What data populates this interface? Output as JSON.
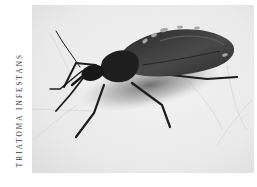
{
  "figure": {
    "caption": "TRIATOMA INFESTANS",
    "photo": {
      "subject": "kissing bug (Triatoma infestans) on pale surface",
      "style": "grayscale photograph",
      "colors": {
        "background": "#ececec",
        "background_light": "#f4f4f4",
        "insect_body": "#1e1e1e",
        "insect_wing": "#3c3c3c",
        "shadow": "#8a8a8a",
        "wing_edge_light": "#9a9a9a"
      }
    }
  }
}
